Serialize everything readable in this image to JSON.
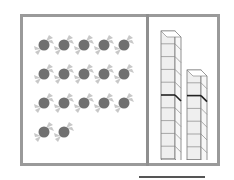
{
  "worksheet": {
    "candies": {
      "count": 17,
      "rows": [
        5,
        5,
        5,
        2
      ],
      "colors": {
        "body": "#707070",
        "wrapper": "#c8c8c8"
      }
    },
    "rods": [
      {
        "name": "tall-rod",
        "cubes": 10,
        "marker_after": 5
      },
      {
        "name": "short-rod",
        "cubes": 7,
        "marker_after": 2
      }
    ],
    "answer_line": ""
  }
}
